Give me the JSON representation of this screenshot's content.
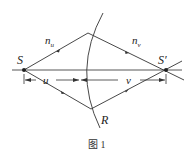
{
  "figure": {
    "caption": "图 1",
    "labels": {
      "source": "S",
      "image": "S′",
      "radius": "R",
      "n_left_base": "n",
      "n_left_sub": "u",
      "n_right_base": "n",
      "n_right_sub": "v",
      "dist_u": "u",
      "dist_v": "v"
    },
    "colors": {
      "line": "#333333",
      "background": "#ffffff"
    }
  }
}
